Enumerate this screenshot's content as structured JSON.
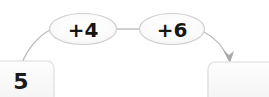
{
  "diagram": {
    "type": "function-machine",
    "title": "",
    "start_box": {
      "value": "5",
      "label": "start-value"
    },
    "operations": [
      {
        "label": "+4",
        "operator": "+",
        "operand": "4"
      },
      {
        "label": "+6",
        "operator": "+",
        "operand": "6"
      }
    ],
    "result_box": {
      "value": "",
      "placeholder": ""
    },
    "connectors": [
      {
        "from": "start-box",
        "to": "operation-1",
        "kind": "curve"
      },
      {
        "from": "operation-1",
        "to": "operation-2",
        "kind": "line"
      },
      {
        "from": "operation-2",
        "to": "result-box",
        "kind": "curve-arrow"
      }
    ],
    "colors": {
      "background": "#ffffff",
      "box_fill": "#fbfbfb",
      "box_stroke": "#d8d8d8",
      "ellipse_fill": "#fafafa",
      "ellipse_stroke": "#cfcfcf",
      "connector": "#b4b4b4",
      "text": "#161616"
    }
  }
}
